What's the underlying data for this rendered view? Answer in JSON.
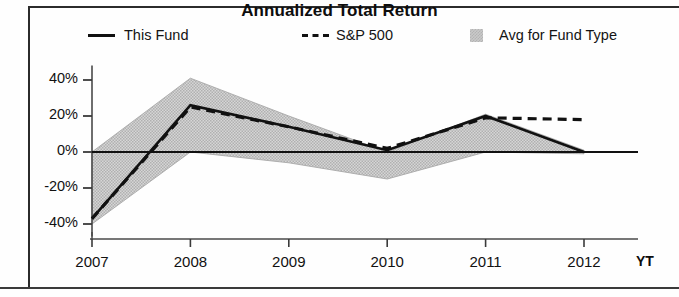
{
  "chart_data": {
    "type": "line",
    "title": "Annualized Total Return",
    "xlabel": "",
    "ylabel": "",
    "categories": [
      "2007",
      "2008",
      "2009",
      "2010",
      "2011",
      "2012"
    ],
    "x_tick_labels": [
      "2007",
      "2008",
      "2009",
      "2010",
      "2011",
      "2012"
    ],
    "x_tick_suffix": "YT",
    "y_tick_labels": [
      "40%",
      "20%",
      "0%",
      "-20%",
      "-40%"
    ],
    "y_tick_values": [
      40,
      20,
      0,
      -20,
      -40
    ],
    "ylim": [
      -48,
      48
    ],
    "grid": false,
    "legend_position": "top",
    "series": [
      {
        "name": "This Fund",
        "style": "solid",
        "color": "#111111",
        "values": [
          -37,
          26,
          14,
          1,
          20,
          0
        ]
      },
      {
        "name": "S&P 500",
        "style": "dashed",
        "color": "#111111",
        "values": [
          -37,
          25,
          14,
          2,
          19,
          18
        ]
      },
      {
        "name": "Avg for Fund Type",
        "style": "band",
        "color": "#c9c9c9",
        "upper": [
          0,
          41,
          20,
          0,
          21,
          1
        ],
        "lower": [
          -40,
          0,
          -6,
          -15,
          0,
          -1
        ]
      }
    ]
  },
  "legend": {
    "this_fund": "This Fund",
    "sp500": "S&P 500",
    "avg_fund_type": "Avg for Fund Type"
  },
  "axis": {
    "y": [
      "40%",
      "20%",
      "0%",
      "-20%",
      "-40%"
    ],
    "x": [
      "2007",
      "2008",
      "2009",
      "2010",
      "2011",
      "2012"
    ],
    "ytd_label": "YT"
  },
  "colors": {
    "line": "#111111",
    "band": "#c9c9c9",
    "text": "#111111",
    "frame": "#2b2b2b"
  }
}
